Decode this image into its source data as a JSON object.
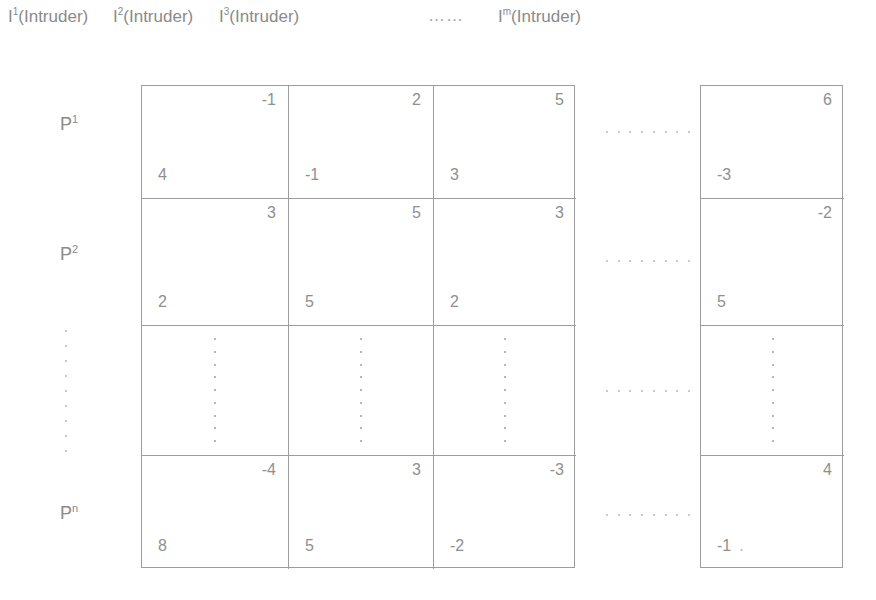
{
  "header": {
    "columns": [
      {
        "symbol": "I",
        "superscript": "1",
        "label": "(Intruder)"
      },
      {
        "symbol": "I",
        "superscript": "2",
        "label": "(Intruder)"
      },
      {
        "symbol": "I",
        "superscript": "3",
        "label": "(Intruder)"
      },
      {
        "symbol": "I",
        "superscript": "m",
        "label": "(Intruder)"
      }
    ],
    "ellipsis": "……"
  },
  "rows": [
    {
      "symbol": "P",
      "superscript": "1"
    },
    {
      "symbol": "P",
      "superscript": "2"
    },
    {
      "symbol": "P",
      "superscript": "n"
    }
  ],
  "matrix": {
    "row1": {
      "c1": {
        "top_right": "-1",
        "bottom_left": "4"
      },
      "c2": {
        "top_right": "2",
        "bottom_left": "-1"
      },
      "c3": {
        "top_right": "5",
        "bottom_left": "3"
      },
      "cm": {
        "top_right": "6",
        "bottom_left": "-3"
      }
    },
    "row2": {
      "c1": {
        "top_right": "3",
        "bottom_left": "2"
      },
      "c2": {
        "top_right": "5",
        "bottom_left": "5"
      },
      "c3": {
        "top_right": "3",
        "bottom_left": "2"
      },
      "cm": {
        "top_right": "-2",
        "bottom_left": "5"
      }
    },
    "row3": {
      "c1": {
        "top_right": "",
        "bottom_left": ""
      },
      "c2": {
        "top_right": "",
        "bottom_left": ""
      },
      "c3": {
        "top_right": "",
        "bottom_left": ""
      },
      "cm": {
        "top_right": "",
        "bottom_left": ""
      }
    },
    "row4": {
      "c1": {
        "top_right": "-4",
        "bottom_left": "8"
      },
      "c2": {
        "top_right": "3",
        "bottom_left": "5"
      },
      "c3": {
        "top_right": "-3",
        "bottom_left": "-2"
      },
      "cm": {
        "top_right": "4",
        "bottom_left": "-1",
        "trailing_dot": "."
      }
    }
  },
  "colors": {
    "grid_line": "#9c9c9c",
    "text": "#8d8d8d",
    "dot": "#b4b4b4",
    "background": "#ffffff"
  }
}
